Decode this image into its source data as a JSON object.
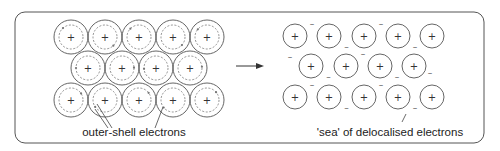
{
  "diagram": {
    "left_panel": {
      "label": "outer-shell electrons",
      "rows": [
        {
          "y": 37,
          "xs": [
            71,
            105,
            139,
            173,
            207
          ]
        },
        {
          "y": 68,
          "xs": [
            88,
            122,
            156,
            190
          ]
        },
        {
          "y": 100,
          "xs": [
            71,
            105,
            139,
            173,
            207
          ]
        }
      ],
      "ion_symbol": "+"
    },
    "right_panel": {
      "label": "'sea' of delocalised electrons",
      "rows": [
        {
          "y": 36,
          "xs": [
            295,
            329,
            364,
            398,
            432
          ]
        },
        {
          "y": 66,
          "xs": [
            311,
            346,
            380,
            414
          ]
        },
        {
          "y": 97,
          "xs": [
            295,
            329,
            364,
            398,
            432
          ]
        }
      ],
      "ion_symbol": "+",
      "electron_symbol": "–"
    },
    "arrow": {
      "from_x": 236,
      "to_x": 264,
      "y": 66
    },
    "colors": {
      "stroke": "#555555",
      "text": "#222222",
      "background": "#ffffff"
    }
  }
}
